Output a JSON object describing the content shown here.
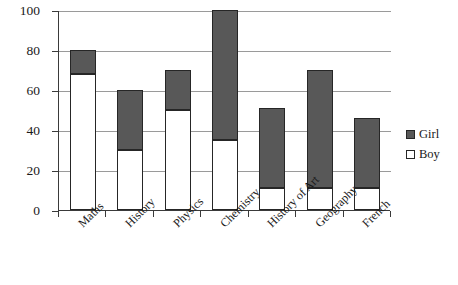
{
  "chart_data": {
    "type": "bar",
    "subtype": "stacked-bar-vertical",
    "title": "",
    "xlabel": "",
    "ylabel": "",
    "ylim": [
      0,
      100
    ],
    "ytick_labels": [
      "0",
      "20",
      "40",
      "60",
      "80",
      "100"
    ],
    "ytick_values": [
      0,
      20,
      40,
      60,
      80,
      100
    ],
    "grid": true,
    "grid_axis": "y",
    "legend_position": "right",
    "categories": [
      "Maths",
      "History",
      "Physics",
      "Chemistry",
      "History of Art",
      "Geography",
      "French"
    ],
    "series": [
      {
        "name": "Boy",
        "color": "#ffffff",
        "edge_color": "#262626",
        "stack_position": "bottom",
        "values": [
          68,
          30,
          50,
          35,
          11,
          11,
          11
        ]
      },
      {
        "name": "Girl",
        "color": "#585858",
        "edge_color": "#262626",
        "stack_position": "top",
        "values": [
          12,
          30,
          20,
          65,
          40,
          59,
          35
        ]
      }
    ],
    "totals": [
      80,
      60,
      70,
      100,
      51,
      70,
      46
    ]
  },
  "legend": {
    "items": [
      {
        "label": "Girl",
        "swatch": "filled-dark-square"
      },
      {
        "label": "Boy",
        "swatch": "open-white-square"
      }
    ]
  }
}
